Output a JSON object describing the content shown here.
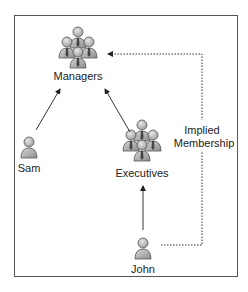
{
  "diagram": {
    "nodes": [
      {
        "id": "managers",
        "label": "Managers",
        "type": "group",
        "icon": "group-icon"
      },
      {
        "id": "sam",
        "label": "Sam",
        "type": "user",
        "icon": "user-icon"
      },
      {
        "id": "executives",
        "label": "Executives",
        "type": "group",
        "icon": "group-icon"
      },
      {
        "id": "john",
        "label": "John",
        "type": "user",
        "icon": "user-icon"
      }
    ],
    "edges": [
      {
        "from": "sam",
        "to": "managers",
        "style": "solid"
      },
      {
        "from": "executives",
        "to": "managers",
        "style": "solid"
      },
      {
        "from": "john",
        "to": "executives",
        "style": "solid"
      },
      {
        "from": "john",
        "to": "managers",
        "style": "dotted",
        "label": "Implied Membership"
      }
    ],
    "implied_label_line1": "Implied",
    "implied_label_line2": "Membership"
  },
  "colors": {
    "border": "#555555",
    "icon_fill": "#b8b8b8",
    "icon_stroke": "#555555",
    "line": "#333333"
  }
}
